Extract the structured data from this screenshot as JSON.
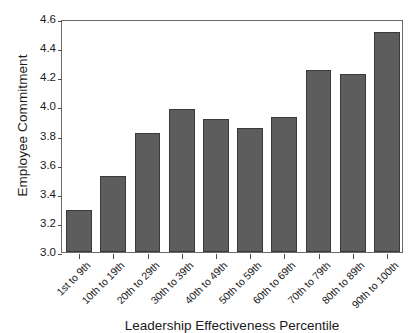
{
  "chart_data": {
    "type": "bar",
    "title": "",
    "xlabel": "Leadership Effectiveness Percentile",
    "ylabel": "Employee Commitment",
    "categories": [
      "1st to 9th",
      "10th to 19th",
      "20th to 29th",
      "30th to 39th",
      "40th to 49th",
      "50th to 59th",
      "60th to 69th",
      "70th to 79th",
      "80th to 89th",
      "90th to 100th"
    ],
    "values": [
      3.29,
      3.52,
      3.82,
      3.98,
      3.91,
      3.85,
      3.93,
      4.25,
      4.22,
      4.51
    ],
    "ylim": [
      3.0,
      4.6
    ],
    "ytick_labels": [
      "3.0",
      "3.2",
      "3.4",
      "3.6",
      "3.8",
      "4.0",
      "4.2",
      "4.4",
      "4.6"
    ],
    "ytick_values": [
      3.0,
      3.2,
      3.4,
      3.6,
      3.8,
      4.0,
      4.2,
      4.4,
      4.6
    ],
    "grid": false,
    "legend": null,
    "bar_color": "#5d5d5d",
    "bar_edge_color": "#3a3a3a",
    "frame_color": "#6b6b6b",
    "background_color": "#ffffff",
    "text_color": "#1a1a1a"
  }
}
